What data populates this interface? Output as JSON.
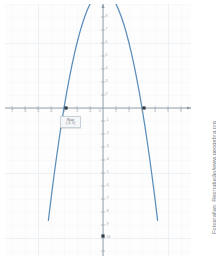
{
  "figure": {
    "kind": "geogebra-graph",
    "background_color": "#ffffff",
    "plot_background_color": "#fdfdfe",
    "grid_color": "#dfe6ee",
    "grid_major_color": "#ccd6e0",
    "axis_color": "#8d98a3",
    "curve_color": "#5b8db8",
    "point_color": "#2f3b47",
    "tick_label_color": "#9aa3ad"
  },
  "credit": {
    "text": "Fotografias: Reprodução/www.geogebra.org"
  },
  "callout": {
    "name": "root-callout",
    "title": "Raiz",
    "coords": "(-3, 0)"
  },
  "chart_data": {
    "type": "line",
    "title": "",
    "subtitle": "",
    "xlabel": "",
    "ylabel": "",
    "grid": true,
    "legend": false,
    "function": "y = x^2 - 9",
    "curve_color": "#5b8db8",
    "xlim": [
      -7.5,
      6.5
    ],
    "ylim": [
      -10.5,
      9.0
    ],
    "x_ticks": [
      -7,
      -6,
      -5,
      -4,
      -3,
      -2,
      -1,
      0,
      1,
      2,
      3,
      4,
      5,
      6
    ],
    "x_tick_labels": [
      "-7",
      "-6",
      "-5",
      "-4",
      "-3",
      "-2",
      "-1",
      "0",
      "1",
      "2",
      "3",
      "4",
      "5",
      "6"
    ],
    "y_ticks": [
      -10,
      -9,
      -8,
      -7,
      -6,
      -5,
      -4,
      -3,
      -2,
      -1,
      1,
      2,
      3,
      4,
      5,
      6,
      7,
      8
    ],
    "y_tick_labels": [
      "-10",
      "-9",
      "-8",
      "-7",
      "-6",
      "-5",
      "-4",
      "-3",
      "-2",
      "-1",
      "1",
      "2",
      "3",
      "4",
      "5",
      "6",
      "7",
      "8"
    ],
    "x": [
      -4.2,
      -4.0,
      -3.8,
      -3.6,
      -3.4,
      -3.2,
      -3.0,
      -2.8,
      -2.6,
      -2.4,
      -2.2,
      -2.0,
      -1.8,
      -1.6,
      -1.4,
      -1.2,
      -1.0,
      -0.8,
      -0.6,
      -0.4,
      -0.2,
      0.0,
      0.2,
      0.4,
      0.6,
      0.8,
      1.0,
      1.2,
      1.4,
      1.6,
      1.8,
      2.0,
      2.2,
      2.4,
      2.6,
      2.8,
      3.0,
      3.2,
      3.4,
      3.6,
      3.8,
      4.0,
      4.2
    ],
    "y": [
      8.64,
      7.0,
      5.44,
      3.96,
      2.56,
      1.24,
      0.0,
      -1.16,
      -2.24,
      -3.24,
      -4.16,
      -5.0,
      -5.76,
      -6.44,
      -7.04,
      -7.56,
      -8.0,
      -8.36,
      -8.64,
      -8.84,
      -8.96,
      -9.0,
      -8.96,
      -8.84,
      -8.64,
      -8.36,
      -8.0,
      -7.56,
      -7.04,
      -6.44,
      -5.76,
      -5.0,
      -4.16,
      -3.24,
      -2.24,
      -1.16,
      0.0,
      1.24,
      2.56,
      3.96,
      5.44,
      7.0,
      8.64
    ],
    "points": [
      {
        "name": "left-root",
        "label": "Raiz",
        "coords": "(-3, 0)",
        "x": -3,
        "y": 0
      },
      {
        "name": "right-root",
        "label": "",
        "coords": "(3, 0)",
        "x": 3,
        "y": 0
      },
      {
        "name": "vertex",
        "label": "",
        "coords": "(0, -9)",
        "x": 0,
        "y": -9
      }
    ],
    "annotations": [
      {
        "text": "Raiz",
        "x": -3,
        "y": 0
      },
      {
        "text": "(-3, 0)",
        "x": -3,
        "y": 0
      }
    ]
  }
}
